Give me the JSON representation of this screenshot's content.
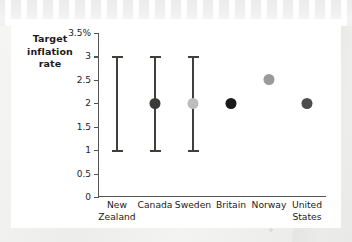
{
  "chart_data": {
    "type": "scatter",
    "title": "",
    "axis_caption": "Target inflation rate",
    "axis_caption_lines": [
      "Target",
      "inflation",
      "rate"
    ],
    "xlabel": "",
    "ylabel": "Target inflation rate",
    "ylim": [
      0,
      3.5
    ],
    "grid": false,
    "legend": "none",
    "ytick_labels": [
      "3.5%",
      "3",
      "2.5",
      "2",
      "1.5",
      "1",
      "0.5",
      "0"
    ],
    "ytick_values": [
      3.5,
      3,
      2.5,
      2,
      1.5,
      1,
      0.5,
      0
    ],
    "categories": [
      "New Zealand",
      "Canada",
      "Sweden",
      "Britain",
      "Norway",
      "United States"
    ],
    "category_lines": [
      [
        "New",
        "Zealand"
      ],
      [
        "Canada"
      ],
      [
        "Sweden"
      ],
      [
        "Britain"
      ],
      [
        "Norway"
      ],
      [
        "United",
        "States"
      ]
    ],
    "points": [
      {
        "category": "New Zealand",
        "target": null,
        "range_low": 1,
        "range_high": 3,
        "has_range": true,
        "has_point": false,
        "color": "#403f3b"
      },
      {
        "category": "Canada",
        "target": 2,
        "range_low": 1,
        "range_high": 3,
        "has_range": true,
        "has_point": true,
        "color": "#3a3a38"
      },
      {
        "category": "Sweden",
        "target": 2,
        "range_low": 1,
        "range_high": 3,
        "has_range": true,
        "has_point": true,
        "color": "#bdbdbb"
      },
      {
        "category": "Britain",
        "target": 2,
        "range_low": null,
        "range_high": null,
        "has_range": false,
        "has_point": true,
        "color": "#1a1a18"
      },
      {
        "category": "Norway",
        "target": 2.5,
        "range_low": null,
        "range_high": null,
        "has_range": false,
        "has_point": true,
        "color": "#9a9a98"
      },
      {
        "category": "United States",
        "target": 2,
        "range_low": null,
        "range_high": null,
        "has_range": false,
        "has_point": true,
        "color": "#4c4c4a"
      }
    ],
    "colors": {
      "axis": "#55544f",
      "errorbar": "#403f3b",
      "card_background": "#ffffff",
      "page_background": "#f1f1f0",
      "text": "#1c1c17"
    }
  }
}
